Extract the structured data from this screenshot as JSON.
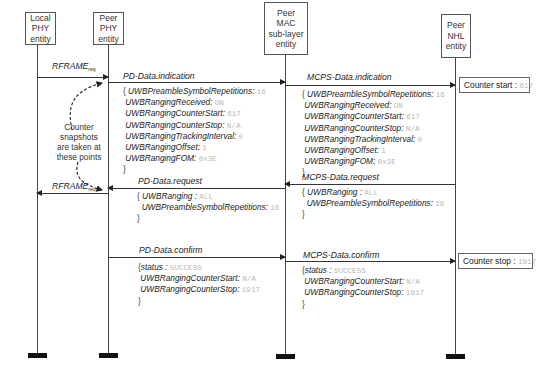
{
  "entities": [
    {
      "id": "local-phy",
      "lines": [
        "Local",
        "PHY",
        "entity"
      ]
    },
    {
      "id": "peer-phy",
      "lines": [
        "Peer",
        "PHY",
        "entity"
      ]
    },
    {
      "id": "peer-mac",
      "lines": [
        "Peer",
        "MAC",
        "sub-layer",
        "entity"
      ]
    },
    {
      "id": "peer-nhl",
      "lines": [
        "Peer",
        "NHL",
        "entity"
      ]
    }
  ],
  "annotation": {
    "lines": [
      "Counter",
      "snapshots",
      "are taken at",
      "these points"
    ]
  },
  "messages": {
    "rframe_req_1": {
      "label": "RFRAME",
      "sub": "req"
    },
    "rframe_req_2": {
      "label": "RFRAME",
      "sub": "req"
    },
    "pd_data_indication": {
      "label": "PD-Data.indication",
      "params": [
        {
          "key": "UWBPreambleSymbolRepetitions",
          "value": "16"
        },
        {
          "key": "UWBRangingReceived",
          "value": "ON"
        },
        {
          "key": "UWBRangingCounterStart",
          "value": "617"
        },
        {
          "key": "UWBRangingCounterStop",
          "value": "N/A"
        },
        {
          "key": "UWBRangingTrackingInterval",
          "value": "0"
        },
        {
          "key": "UWBRangingOffset",
          "value": "1"
        },
        {
          "key": "UWBRangingFOM",
          "value": "0x3E"
        }
      ]
    },
    "mcps_data_indication": {
      "label": "MCPS-Data.indication",
      "params": [
        {
          "key": "UWBPreambleSymbolRepetitions",
          "value": "16"
        },
        {
          "key": "UWBRangingReceived",
          "value": "ON"
        },
        {
          "key": "UWBRangingCounterStart",
          "value": "617"
        },
        {
          "key": "UWBRangingCounterStop",
          "value": "N/A"
        },
        {
          "key": "UWBRangingTrackingInterval",
          "value": "0"
        },
        {
          "key": "UWBRangingOffset",
          "value": "1"
        },
        {
          "key": "UWBRangingFOM",
          "value": "0x3E"
        }
      ]
    },
    "pd_data_request": {
      "label": "PD-Data.request",
      "params": [
        {
          "key": "UWBRanging",
          "value": "ALL"
        },
        {
          "key": "UWBPreambleSymbolRepetitions",
          "value": "16"
        }
      ]
    },
    "mcps_data_request": {
      "label": "MCPS-Data.request",
      "params": [
        {
          "key": "UWBRanging",
          "value": "ALL"
        },
        {
          "key": "UWBPreambleSymbolRepetitions",
          "value": "16"
        }
      ]
    },
    "pd_data_confirm": {
      "label": "PD-Data.confirm",
      "params": [
        {
          "key": "status",
          "value": "SUCCESS"
        },
        {
          "key": "UWBRangingCounterStart",
          "value": "N/A"
        },
        {
          "key": "UWBRangingCounterStop",
          "value": "1917"
        }
      ]
    },
    "mcps_data_confirm": {
      "label": "MCPS-Data.confirm",
      "params": [
        {
          "key": "status",
          "value": "SUCCESS"
        },
        {
          "key": "UWBRangingCounterStart",
          "value": "N/A"
        },
        {
          "key": "UWBRangingCounterStop",
          "value": "1917"
        }
      ]
    }
  },
  "notes": {
    "counter_start": {
      "label": "Counter start :",
      "value": "617"
    },
    "counter_stop": {
      "label": "Counter stop :",
      "value": "1917"
    }
  },
  "punct": {
    "open": "{",
    "close": "}",
    "sep": ": "
  }
}
